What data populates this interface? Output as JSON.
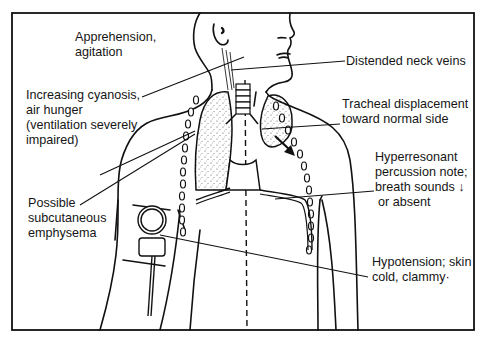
{
  "diagram": {
    "type": "medical-illustration",
    "labels": {
      "apprehension": {
        "lines": [
          "Apprehension,",
          "agitation"
        ]
      },
      "neck_veins": {
        "lines": [
          "Distended neck veins"
        ]
      },
      "cyanosis": {
        "lines": [
          "Increasing cyanosis,",
          "air hunger",
          "(ventilation severely",
          "impaired)"
        ]
      },
      "tracheal": {
        "lines": [
          "Tracheal displacement",
          "toward normal side"
        ]
      },
      "hyperresonant": {
        "lines": [
          "Hyperresonant",
          "percussion note;",
          "breath sounds ↓",
          "or absent"
        ]
      },
      "subcutaneous": {
        "lines": [
          "Possible",
          "subcutaneous",
          "emphysema"
        ]
      },
      "hypotension": {
        "lines": [
          "Hypotension; skin",
          "cold, clammy·"
        ]
      }
    },
    "colors": {
      "line": "#111111",
      "background": "#ffffff",
      "lung_stipple": "#555555"
    }
  }
}
